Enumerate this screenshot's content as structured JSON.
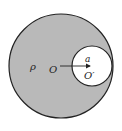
{
  "diagram": {
    "type": "sphere-with-cavity",
    "colors": {
      "background": "#ffffff",
      "large_fill": "#b9b9b9",
      "cavity_fill": "#ffffff",
      "stroke": "#222222"
    },
    "large_circle": {
      "cx": 61,
      "cy": 66,
      "r": 52,
      "center_label": "O"
    },
    "cavity": {
      "cx": 92,
      "cy": 66,
      "r": 20,
      "center_label": "O′"
    },
    "density_label": "ρ",
    "vector": {
      "from": "O",
      "to": "O′",
      "label": "a"
    }
  }
}
